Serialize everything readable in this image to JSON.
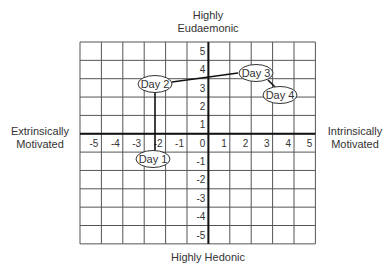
{
  "labels": {
    "top": [
      "Highly",
      "Eudaemonic"
    ],
    "bottom": "Highly Hedonic",
    "left": [
      "Extrinsically",
      "Motivated"
    ],
    "right": [
      "Intrinsically",
      "Motivated"
    ]
  },
  "axes": {
    "x_ticks": [
      "-5",
      "-4",
      "-3",
      "-2",
      "-1",
      "0",
      "1",
      "2",
      "3",
      "4",
      "5"
    ],
    "y_ticks_pos": [
      "5",
      "4",
      "3",
      "2",
      "1"
    ],
    "y_ticks_neg": [
      "-1",
      "-2",
      "-3",
      "-4",
      "-5"
    ]
  },
  "points": [
    {
      "label": "Day 1",
      "x": -2.3,
      "y": -0.6
    },
    {
      "label": "Day 2",
      "x": -2.3,
      "y": 3.4
    },
    {
      "label": "Day 3",
      "x": 2.3,
      "y": 3.7
    },
    {
      "label": "Day 4",
      "x": 3.3,
      "y": 2.9
    }
  ],
  "chart_data": {
    "type": "scatter",
    "title": "",
    "xlabel_left": "Extrinsically Motivated",
    "xlabel_right": "Intrinsically Motivated",
    "ylabel_top": "Highly Eudaemonic",
    "ylabel_bottom": "Highly Hedonic",
    "xlim": [
      -5,
      5
    ],
    "ylim": [
      -5,
      5
    ],
    "grid": true,
    "series": [
      {
        "name": "Days",
        "points": [
          {
            "label": "Day 1",
            "x": -2.3,
            "y": -0.6
          },
          {
            "label": "Day 2",
            "x": -2.3,
            "y": 3.4
          },
          {
            "label": "Day 3",
            "x": 2.3,
            "y": 3.7
          },
          {
            "label": "Day 4",
            "x": 3.3,
            "y": 2.9
          }
        ]
      }
    ],
    "connections": [
      [
        "Day 1",
        "Day 2"
      ],
      [
        "Day 2",
        "Day 3"
      ],
      [
        "Day 3",
        "Day 4"
      ]
    ]
  }
}
